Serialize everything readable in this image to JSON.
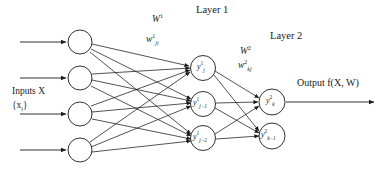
{
  "figure": {
    "kind": "neural-network-diagram",
    "background": "#ffffff",
    "stroke_color": "#1a1a1a"
  },
  "labels": {
    "inputs_title": "Inputs X",
    "inputs_set": "{x",
    "inputs_set_sub": "i",
    "inputs_set_close": "}",
    "layer1": "Layer 1",
    "layer2": "Layer 2",
    "weight1_matrix": "W",
    "weight1_matrix_sup": "1",
    "weight1_elem": "w",
    "weight1_elem_sup": "1",
    "weight1_elem_sub": "ji",
    "weight2_matrix": "W",
    "weight2_matrix_sup": "2",
    "weight2_elem": "w",
    "weight2_elem_sup": "2",
    "weight2_elem_sub": "kj",
    "output": "Output f(X, W)"
  },
  "layers": {
    "input": {
      "name": "input-layer",
      "node_count": 4,
      "cx": 80,
      "r": 12,
      "cy": [
        42,
        78,
        114,
        150
      ],
      "node_labels": [
        "",
        "",
        "",
        ""
      ]
    },
    "hidden1": {
      "name": "layer-1",
      "node_count": 3,
      "cx": 203,
      "r": 12.5,
      "cy": [
        68,
        104,
        138
      ],
      "node_labels": [
        {
          "base": "y",
          "sup": "1",
          "sub": "j"
        },
        {
          "base": "y",
          "sup": "1",
          "sub": "j−1"
        },
        {
          "base": "y",
          "sup": "1",
          "sub": "j−2"
        }
      ]
    },
    "hidden2": {
      "name": "layer-2",
      "node_count": 2,
      "cx": 272,
      "r": 13,
      "cy": [
        102,
        136
      ],
      "node_labels": [
        {
          "base": "y",
          "sup": "2",
          "sub": "k"
        },
        {
          "base": "y",
          "sup": "2",
          "sub": "k−1"
        }
      ]
    }
  },
  "arrows": {
    "input_arrows": {
      "x_start": 20,
      "x_end": 67,
      "y": [
        42,
        78,
        114,
        150
      ]
    },
    "output_arrow": {
      "x_start": 286,
      "x_end": 375,
      "y": 102
    }
  },
  "label_positions": {
    "inputs_title": {
      "x": 12,
      "y": 93
    },
    "inputs_set": {
      "x": 12,
      "y": 106
    },
    "layer1": {
      "x": 196,
      "y": 11
    },
    "layer2": {
      "x": 272,
      "y": 36
    },
    "weight1_matrix": {
      "x": 152,
      "y": 21
    },
    "weight1_elem": {
      "x": 146,
      "y": 41
    },
    "weight2_matrix": {
      "x": 240,
      "y": 53
    },
    "weight2_elem": {
      "x": 238,
      "y": 67
    },
    "output": {
      "x": 297,
      "y": 84
    }
  }
}
